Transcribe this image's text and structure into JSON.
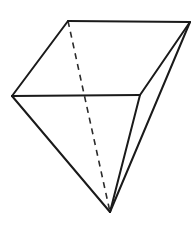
{
  "figure": {
    "name": "polyhedron-line-drawing",
    "background_color": "#ffffff",
    "stroke_color": "#1a1a1a",
    "hidden_stroke_color": "#2b2b2b",
    "stroke_width": "2",
    "hidden_stroke_width": "1.6",
    "hidden_dash_pattern": "6 5",
    "canvas": {
      "width": 195,
      "height": 227
    },
    "vertices": [
      {
        "id": "A",
        "label": "top-left",
        "x": 68,
        "y": 21
      },
      {
        "id": "B",
        "label": "top-right",
        "x": 190,
        "y": 22
      },
      {
        "id": "C",
        "label": "left",
        "x": 12,
        "y": 96
      },
      {
        "id": "D",
        "label": "mid-right",
        "x": 140,
        "y": 95
      },
      {
        "id": "E",
        "label": "apex-bottom",
        "x": 110,
        "y": 212
      }
    ],
    "edges": [
      {
        "id": "AB",
        "from": "A",
        "to": "B",
        "style": "solid",
        "points": "68,21 190,22"
      },
      {
        "id": "AC",
        "from": "A",
        "to": "C",
        "style": "solid",
        "points": "68,21 12,96"
      },
      {
        "id": "CD",
        "from": "C",
        "to": "D",
        "style": "solid",
        "points": "12,96 140,95"
      },
      {
        "id": "BD",
        "from": "B",
        "to": "D",
        "style": "solid",
        "points": "190,22 140,95"
      },
      {
        "id": "CE",
        "from": "C",
        "to": "E",
        "style": "solid",
        "points": "12,96 110,212"
      },
      {
        "id": "DE",
        "from": "D",
        "to": "E",
        "style": "solid",
        "points": "140,95 110,212"
      },
      {
        "id": "BE",
        "from": "B",
        "to": "E",
        "style": "solid",
        "points": "190,22 110,212"
      },
      {
        "id": "AE",
        "from": "A",
        "to": "E",
        "style": "dashed",
        "points": "68,21 110,212"
      }
    ],
    "faces": [
      {
        "id": "top-face",
        "vertices": "A,B,D,C",
        "points": "68,21 190,22 140,95 12,96"
      },
      {
        "id": "front-left-face",
        "vertices": "C,D,E",
        "points": "12,96 140,95 110,212"
      },
      {
        "id": "right-face",
        "vertices": "B,D,E",
        "points": "190,22 140,95 110,212"
      }
    ]
  }
}
